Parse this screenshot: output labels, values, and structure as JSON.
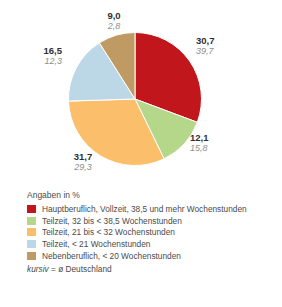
{
  "chart_data": {
    "type": "pie",
    "title": "",
    "unit_note": "Angaben in %",
    "categories": [
      "Hauptberuflich, Vollzeit, 38,5 und mehr Wochenstunden",
      "Teilzeit, 32 bis < 38,5 Wochenstunden",
      "Teilzeit, 21 bis < 32 Wochenstunden",
      "Teilzeit, < 21 Wochenstunden",
      "Nebenberuflich, < 20 Wochenstunden"
    ],
    "values": [
      30.7,
      12.1,
      31.7,
      16.5,
      9.0
    ],
    "value_labels": [
      "30,7",
      "12,1",
      "31,7",
      "16,5",
      "9,0"
    ],
    "average_labels": [
      "39,7",
      "15,8",
      "29,3",
      "12,3",
      "2,8"
    ],
    "averages": [
      39.7,
      15.8,
      29.3,
      12.3,
      2.8
    ],
    "colors": [
      "#c0161c",
      "#b4d78a",
      "#fbbe6b",
      "#bcd7e6",
      "#c09a63"
    ],
    "legend_position": "bottom",
    "grid": false,
    "start_angle_deg": 0,
    "direction": "clockwise"
  },
  "labels": {
    "red": {
      "value": "30,7",
      "average": "39,7"
    },
    "green": {
      "value": "12,1",
      "average": "15,8"
    },
    "orange": {
      "value": "31,7",
      "average": "29,3"
    },
    "blue": {
      "value": "16,5",
      "average": "12,3"
    },
    "tan": {
      "value": "9,0",
      "average": "2,8"
    }
  },
  "legend": {
    "title": "Angaben in %",
    "items": [
      {
        "label": "Hauptberuflich, Vollzeit, 38,5 und mehr Wochenstunden",
        "color": "#c0161c"
      },
      {
        "label": "Teilzeit, 32 bis < 38,5 Wochenstunden",
        "color": "#b4d78a"
      },
      {
        "label": "Teilzeit, 21 bis < 32 Wochenstunden",
        "color": "#fbbe6b"
      },
      {
        "label": "Teilzeit, < 21 Wochenstunden",
        "color": "#bcd7e6"
      },
      {
        "label": "Nebenberuflich, < 20 Wochenstunden",
        "color": "#c09a63"
      }
    ],
    "note_italic": "kursiv",
    "note_rest": " =  ø Deutschland"
  }
}
